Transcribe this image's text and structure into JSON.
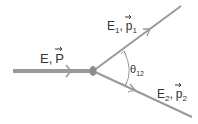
{
  "diagram": {
    "type": "particle-decay",
    "colors": {
      "line": "#999999",
      "text": "#333333",
      "vertex": "#8c8c8c"
    },
    "incoming": {
      "energy": "E",
      "sep": ",",
      "momentum": "P"
    },
    "outgoing_1": {
      "energy": "E",
      "energy_sub": "1",
      "sep": ",",
      "momentum": "p",
      "momentum_sub": "1"
    },
    "outgoing_2": {
      "energy": "E",
      "energy_sub": "2",
      "sep": ",",
      "momentum": "p",
      "momentum_sub": "2"
    },
    "angle": {
      "symbol": "θ",
      "sub": "12"
    }
  }
}
